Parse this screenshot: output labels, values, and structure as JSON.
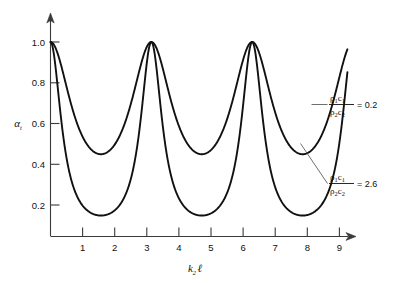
{
  "chart_data": {
    "type": "line",
    "title": "",
    "subtitle": "",
    "xlabel": "k₂ℓ",
    "ylabel": "αₜ",
    "xlim": [
      0,
      9.6
    ],
    "ylim": [
      0,
      1.08
    ],
    "grid": false,
    "legend_position": "inline-annotations",
    "xticks": [
      1,
      2,
      3,
      4,
      5,
      6,
      7,
      8,
      9
    ],
    "xticklabels": [
      "1",
      "2",
      "3",
      "4",
      "5",
      "6",
      "7",
      "8",
      "9"
    ],
    "yticks": [
      0.2,
      0.4,
      0.6,
      0.8,
      1.0
    ],
    "yticklabels": [
      "0.2",
      "0.4",
      "0.6",
      "0.8",
      "1.0"
    ],
    "formula": "alpha_t = 1 / (1 + 0.25*(m - 1/m)^2 * sin^2(k2*l))",
    "series": [
      {
        "name": "ρ₁c₁/ρ₂c₂ = 0.2",
        "m": 0.2,
        "peak_value": 1.0,
        "min_value": 0.44,
        "peak_x": [
          0,
          3.14,
          6.28,
          9.42
        ],
        "min_x": [
          1.57,
          4.71,
          7.85
        ],
        "x": [
          0,
          0.2,
          0.4,
          0.6,
          0.8,
          1.0,
          1.2,
          1.4,
          1.571,
          1.8,
          2.0,
          2.2,
          2.4,
          2.6,
          2.8,
          3.0,
          3.142,
          3.3,
          3.5,
          3.7,
          3.9,
          4.1,
          4.3,
          4.5,
          4.712,
          4.9,
          5.1,
          5.3,
          5.5,
          5.7,
          5.9,
          6.1,
          6.283,
          6.5,
          6.7,
          6.9,
          7.1,
          7.3,
          7.5,
          7.7,
          7.854,
          8.1,
          8.3,
          8.5,
          8.7,
          8.9,
          9.1,
          9.25
        ],
        "y": [
          1.0,
          0.929,
          0.773,
          0.623,
          0.517,
          0.464,
          0.446,
          0.441,
          0.441,
          0.446,
          0.464,
          0.502,
          0.568,
          0.667,
          0.798,
          0.931,
          1.0,
          0.963,
          0.846,
          0.705,
          0.586,
          0.507,
          0.464,
          0.445,
          0.441,
          0.442,
          0.451,
          0.477,
          0.53,
          0.617,
          0.742,
          0.886,
          1.0,
          0.954,
          0.828,
          0.687,
          0.572,
          0.498,
          0.46,
          0.443,
          0.441,
          0.445,
          0.459,
          0.492,
          0.552,
          0.645,
          0.775,
          0.868
        ]
      },
      {
        "name": "ρ₁c₁/ρ₂c₂ = 2.6",
        "m": 2.6,
        "peak_value": 1.0,
        "min_value": 0.12,
        "peak_x": [
          0,
          3.14,
          6.28,
          9.42
        ],
        "min_x": [
          1.57,
          4.71,
          7.85
        ],
        "x": [
          0,
          0.2,
          0.4,
          0.6,
          0.8,
          1.0,
          1.2,
          1.4,
          1.571,
          1.8,
          2.0,
          2.2,
          2.4,
          2.6,
          2.8,
          3.0,
          3.142,
          3.3,
          3.5,
          3.7,
          3.9,
          4.1,
          4.3,
          4.5,
          4.712,
          4.9,
          5.1,
          5.3,
          5.5,
          5.7,
          5.9,
          6.1,
          6.283,
          6.5,
          6.7,
          6.9,
          7.1,
          7.3,
          7.5,
          7.7,
          7.854,
          8.1,
          8.3,
          8.5,
          8.7,
          8.9,
          9.1,
          9.25
        ],
        "y": [
          1.0,
          0.76,
          0.463,
          0.283,
          0.187,
          0.144,
          0.127,
          0.122,
          0.121,
          0.127,
          0.144,
          0.177,
          0.238,
          0.345,
          0.54,
          0.824,
          1.0,
          0.889,
          0.617,
          0.383,
          0.245,
          0.172,
          0.137,
          0.123,
          0.121,
          0.123,
          0.131,
          0.153,
          0.201,
          0.291,
          0.46,
          0.74,
          1.0,
          0.95,
          0.694,
          0.432,
          0.268,
          0.182,
          0.14,
          0.123,
          0.121,
          0.126,
          0.139,
          0.167,
          0.222,
          0.325,
          0.513,
          0.7
        ]
      }
    ],
    "annotations": [
      {
        "id": "annotation-upper",
        "numerator": "ρ₁c₁",
        "denominator": "ρ₂c₂",
        "equals": "= 0.2",
        "value": 0.2
      },
      {
        "id": "annotation-lower",
        "numerator": "ρ₁c₁",
        "denominator": "ρ₂c₂",
        "equals": "= 2.6",
        "value": 2.6
      }
    ]
  },
  "axes": {
    "x_title": "k₂ℓ",
    "x_title_base": "k",
    "x_title_sub": "2",
    "x_title_tail": "ℓ",
    "y_title_base": "α",
    "y_title_sub": "t"
  },
  "ticks": {
    "x": [
      "1",
      "2",
      "3",
      "4",
      "5",
      "6",
      "7",
      "8",
      "9"
    ],
    "y": [
      "1.0",
      "0.8",
      "0.6",
      "0.4",
      "0.2"
    ]
  },
  "annotation_upper": {
    "numerator_rho": "ρ",
    "numerator_rho_sub": "1",
    "numerator_c": "c",
    "numerator_c_sub": "1",
    "denominator_rho": "ρ",
    "denominator_rho_sub": "2",
    "denominator_c": "c",
    "denominator_c_sub": "2",
    "equals_value": "= 0.2"
  },
  "annotation_lower": {
    "numerator_rho": "ρ",
    "numerator_rho_sub": "1",
    "numerator_c": "c",
    "numerator_c_sub": "1",
    "denominator_rho": "ρ",
    "denominator_rho_sub": "2",
    "denominator_c": "c",
    "denominator_c_sub": "2",
    "equals_value": "= 2.6"
  },
  "colors": {
    "curve": "#111111",
    "axis": "#3a3a3a",
    "background": "#ffffff",
    "leader": "#4a4a4a"
  }
}
